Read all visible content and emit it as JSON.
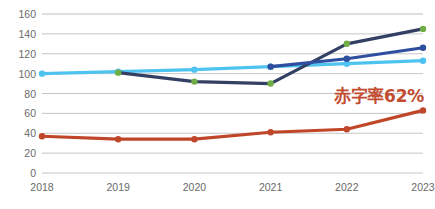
{
  "chart_data": {
    "type": "line",
    "title": "",
    "xlabel": "",
    "ylabel": "",
    "categories": [
      "2018",
      "2019",
      "2020",
      "2021",
      "2022",
      "2023"
    ],
    "ylim": [
      0,
      160
    ],
    "ytick_step": 20,
    "yticks": [
      "160",
      "140",
      "120",
      "100",
      "80",
      "60",
      "40",
      "20",
      "0"
    ],
    "grid": "horizontal",
    "legend": "none",
    "series": [
      {
        "name": "light-blue-series",
        "color": "#4EC3F0",
        "marker_color": "#4EC3F0",
        "x": [
          "2018",
          "2019",
          "2020",
          "2021",
          "2022",
          "2023"
        ],
        "values": [
          100,
          102,
          104,
          107,
          110,
          113
        ]
      },
      {
        "name": "navy-green-marker-series",
        "color": "#333F63",
        "marker_color": "#70AD47",
        "x": [
          "2019",
          "2020",
          "2021",
          "2022",
          "2023"
        ],
        "values": [
          101,
          92,
          90,
          130,
          145
        ]
      },
      {
        "name": "medium-blue-series",
        "color": "#2E4E9E",
        "marker_color": "#2E4E9E",
        "x": [
          "2021",
          "2022",
          "2023"
        ],
        "values": [
          107,
          115,
          126
        ]
      },
      {
        "name": "red-series",
        "color": "#C0462A",
        "marker_color": "#C0462A",
        "x": [
          "2018",
          "2019",
          "2020",
          "2021",
          "2022",
          "2023"
        ],
        "values": [
          37,
          34,
          34,
          41,
          44,
          63
        ]
      }
    ],
    "annotations": [
      {
        "text": "赤字率62%",
        "color": "#c24b30",
        "near_value": 62,
        "near_category": "2023"
      }
    ]
  },
  "colors": {
    "grid": "#bfbfbf",
    "tick_text": "#6a6a6a",
    "background": "#ffffff",
    "annotation": "#c24b30"
  }
}
